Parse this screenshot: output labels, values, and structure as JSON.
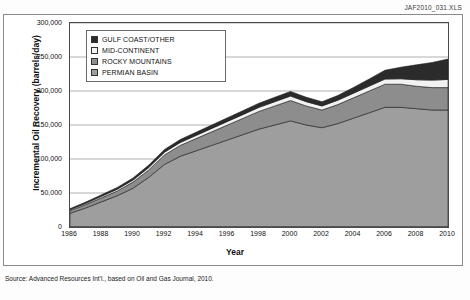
{
  "figure": {
    "workbook_code": "JAF2010_031.XLS",
    "source_note": "Source: Advanced Resources Int'l., based on Oil and Gas Journal, 2010."
  },
  "legend": {
    "position": "inside-top-left",
    "items": [
      {
        "label": "GULF COAST/OTHER",
        "color": "#2b2b2b",
        "swatch": "legend-swatch-gulf-coast"
      },
      {
        "label": "MID-CONTINENT",
        "color": "#f2f2f2",
        "swatch": "legend-swatch-mid-continent"
      },
      {
        "label": "ROCKY MOUNTAINS",
        "color": "#8d8d8d",
        "swatch": "legend-swatch-rocky-mountains"
      },
      {
        "label": "PERMIAN BASIN",
        "color": "#9e9e9e",
        "swatch": "legend-swatch-permian-basin"
      }
    ]
  },
  "chart_data": {
    "type": "area",
    "stacked": true,
    "title": "",
    "xlabel": "Year",
    "ylabel": "Incremental Oil Recovery (barrels/day)",
    "xlim": [
      1986,
      2010
    ],
    "ylim": [
      0,
      300000
    ],
    "ytick_labels": [
      "300,000",
      "250,000",
      "200,000",
      "150,000",
      "100,000",
      "50,000",
      "0"
    ],
    "ytick_values": [
      300000,
      250000,
      200000,
      150000,
      100000,
      50000,
      0
    ],
    "xtick_labels": [
      "1986",
      "1988",
      "1990",
      "1992",
      "1994",
      "1996",
      "1998",
      "2000",
      "2002",
      "2004",
      "2006",
      "2008",
      "2010"
    ],
    "grid": "horizontal",
    "x": [
      1986,
      1987,
      1988,
      1989,
      1990,
      1991,
      1992,
      1993,
      1994,
      1995,
      1996,
      1997,
      1998,
      1999,
      2000,
      2001,
      2002,
      2003,
      2004,
      2005,
      2006,
      2007,
      2008,
      2009,
      2010
    ],
    "series": [
      {
        "name": "PERMIAN BASIN",
        "color": "#9e9e9e",
        "values": [
          20000,
          28000,
          37000,
          46000,
          57000,
          73000,
          92000,
          104000,
          112000,
          120000,
          128000,
          136000,
          144000,
          150000,
          156000,
          150000,
          146000,
          152000,
          160000,
          168000,
          176000,
          176000,
          174000,
          172000,
          172000
        ]
      },
      {
        "name": "ROCKY MOUNTAINS",
        "color": "#8d8d8d",
        "values": [
          4000,
          5000,
          6000,
          7000,
          9000,
          11000,
          14000,
          16000,
          18000,
          20000,
          22000,
          24000,
          26000,
          28000,
          30000,
          28000,
          26000,
          28000,
          30000,
          32000,
          34000,
          34000,
          33000,
          33000,
          33000
        ]
      },
      {
        "name": "MID-CONTINENT",
        "color": "#f2f2f2",
        "values": [
          1500,
          1800,
          2200,
          2600,
          3000,
          3500,
          4000,
          4300,
          4600,
          5000,
          5300,
          5600,
          6000,
          6300,
          6600,
          6300,
          6000,
          6400,
          6800,
          7200,
          7600,
          8000,
          9500,
          11000,
          12000
        ]
      },
      {
        "name": "GULF COAST/OTHER",
        "color": "#2b2b2b",
        "values": [
          1500,
          1800,
          2200,
          2600,
          3000,
          3500,
          4000,
          4300,
          4700,
          5000,
          5400,
          5700,
          6100,
          6400,
          6800,
          6500,
          6200,
          7000,
          8500,
          10500,
          13000,
          17000,
          22000,
          26000,
          30000
        ]
      }
    ],
    "totals": [
      27000,
      36600,
      47400,
      58200,
      72000,
      91000,
      114000,
      128600,
      139300,
      150000,
      160700,
      171300,
      182100,
      190700,
      199400,
      190800,
      184200,
      193400,
      205300,
      217700,
      230600,
      235000,
      238500,
      242000,
      247000
    ]
  }
}
